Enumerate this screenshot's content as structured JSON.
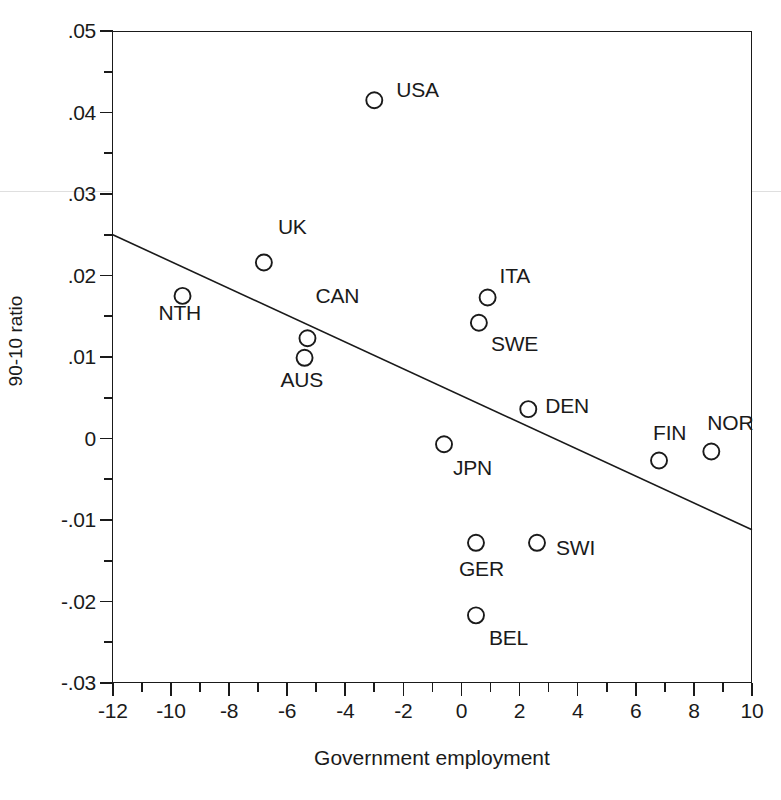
{
  "figure": {
    "background": "#ffffff",
    "ink_color": "#1a1a1a"
  },
  "axes": {
    "x_title": "Government employment",
    "y_title": "90-10 ratio",
    "x_tick_labels": [
      "-12",
      "-10",
      "-8",
      "-6",
      "-4",
      "-2",
      "0",
      "2",
      "4",
      "6",
      "8",
      "10"
    ],
    "y_tick_labels": [
      ".05",
      ".04",
      ".03",
      ".02",
      ".01",
      "0",
      "-.01",
      "-.02",
      "-.03"
    ]
  },
  "chart_data": {
    "type": "scatter",
    "title": "",
    "xlabel": "Government employment",
    "ylabel": "90-10 ratio",
    "xlim": [
      -12,
      10
    ],
    "ylim": [
      -0.03,
      0.05
    ],
    "xticks": [
      -12,
      -10,
      -8,
      -6,
      -4,
      -2,
      0,
      2,
      4,
      6,
      8,
      10
    ],
    "yticks": [
      0.05,
      0.04,
      0.03,
      0.02,
      0.01,
      0,
      -0.01,
      -0.02,
      -0.03
    ],
    "grid": false,
    "legend": "none",
    "marker": "open-circle",
    "points": [
      {
        "label": "USA",
        "x": -3.0,
        "y": 0.0415,
        "label_dx": 22,
        "label_dy": -11
      },
      {
        "label": "UK",
        "x": -6.8,
        "y": 0.0216,
        "label_dx": 14,
        "label_dy": -36
      },
      {
        "label": "NTH",
        "x": -9.6,
        "y": 0.0175,
        "label_dx": -24,
        "label_dy": 16
      },
      {
        "label": "CAN",
        "x": -5.3,
        "y": 0.0123,
        "label_dx": 8,
        "label_dy": -43
      },
      {
        "label": "AUS",
        "x": -5.4,
        "y": 0.0099,
        "label_dx": -24,
        "label_dy": 21
      },
      {
        "label": "ITA",
        "x": 0.9,
        "y": 0.0173,
        "label_dx": 12,
        "label_dy": -23
      },
      {
        "label": "SWE",
        "x": 0.6,
        "y": 0.0142,
        "label_dx": 12,
        "label_dy": 20
      },
      {
        "label": "DEN",
        "x": 2.3,
        "y": 0.0036,
        "label_dx": 17,
        "label_dy": -4
      },
      {
        "label": "FIN",
        "x": 6.8,
        "y": -0.0027,
        "label_dx": -6,
        "label_dy": -29
      },
      {
        "label": "NOR",
        "x": 8.6,
        "y": -0.0016,
        "label_dx": -4,
        "label_dy": -30
      },
      {
        "label": "JPN",
        "x": -0.6,
        "y": -0.0007,
        "label_dx": 9,
        "label_dy": 23
      },
      {
        "label": "GER",
        "x": 0.5,
        "y": -0.0128,
        "label_dx": -17,
        "label_dy": 25
      },
      {
        "label": "SWI",
        "x": 2.6,
        "y": -0.0128,
        "label_dx": 19,
        "label_dy": 4
      },
      {
        "label": "BEL",
        "x": 0.5,
        "y": -0.0217,
        "label_dx": 13,
        "label_dy": 22
      }
    ],
    "fit_line": {
      "type": "linear-fit",
      "x_start": -12,
      "y_start": 0.025,
      "x_end": 10,
      "y_end": -0.0112
    }
  }
}
